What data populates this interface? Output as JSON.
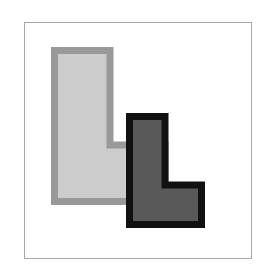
{
  "scene": {
    "title": "Two overlapping L-shaped polygons",
    "canvas_width": 276,
    "canvas_height": 269,
    "background_color": "#ffffff"
  },
  "frame": {
    "name": "figure-border",
    "x": 24,
    "y": 22,
    "width": 228,
    "height": 237,
    "fill_color": "#ffffff",
    "border_color": "#a8a8a8",
    "border_width": 1
  },
  "shapes": [
    {
      "id": "light-l-shape",
      "label": "Light gray L shape",
      "z_order": 1,
      "fill_color": "#cccccc",
      "stroke_color": "#999999",
      "stroke_width": 7,
      "points": "54.5,50.5 110,50.5 110,145 165,145 165,201.5 54.5,201.5"
    },
    {
      "id": "dark-l-shape",
      "label": "Dark gray L shape",
      "z_order": 2,
      "fill_color": "#595959",
      "stroke_color": "#111111",
      "stroke_width": 7,
      "points": "129.5,116.5 165,116.5 165,185 201.5,185 201.5,224.5 129.5,224.5"
    }
  ]
}
